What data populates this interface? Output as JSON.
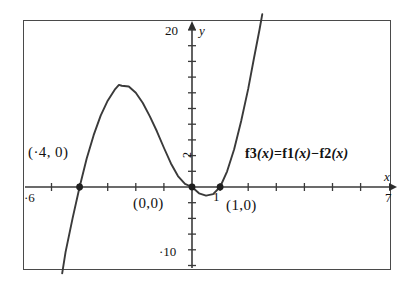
{
  "chart_data": {
    "type": "line",
    "title": "",
    "xlabel": "x",
    "ylabel": "y",
    "xlim": [
      -6,
      7
    ],
    "ylim": [
      -10,
      20
    ],
    "grid": false,
    "legend": null,
    "annotations": {
      "formula": "f3(x)=f1(x)−f2(x)",
      "formula_parts": {
        "f3": "f3",
        "eq": "=",
        "f1": "f1",
        "minus": "−",
        "f2": "f2",
        "var": "x"
      }
    },
    "axis_tick_labels": {
      "x_left": "·6",
      "x_right": "7",
      "x_one": "1",
      "y_top": "20",
      "y_bottom": "·10",
      "y_two": "2"
    },
    "x_ticks": [
      -6,
      -5,
      -4,
      -3,
      -2,
      -1,
      0,
      1,
      2,
      3,
      4,
      5,
      6,
      7
    ],
    "y_ticks": [
      -10,
      -8,
      -6,
      -4,
      -2,
      0,
      2,
      4,
      6,
      8,
      10,
      12,
      14,
      16,
      18,
      20
    ],
    "marked_points": [
      {
        "label": "(·4, 0)",
        "x": -4,
        "y": 0
      },
      {
        "label": "(0,0)",
        "x": 0,
        "y": 0
      },
      {
        "label": "(1,0)",
        "x": 1,
        "y": 0
      }
    ],
    "series": [
      {
        "name": "f3",
        "roots": [
          -4,
          0,
          1
        ],
        "local_max": {
          "x": -2.6,
          "y": 13.0
        },
        "local_min": {
          "x": 0.55,
          "y": -1.1
        },
        "color": "#3a3a3a",
        "points": [
          {
            "x": -4.62,
            "y": -11.0
          },
          {
            "x": -4.5,
            "y": -8.3
          },
          {
            "x": -4.25,
            "y": -4.0
          },
          {
            "x": -4.0,
            "y": 0.0
          },
          {
            "x": -3.75,
            "y": 3.6
          },
          {
            "x": -3.5,
            "y": 6.6
          },
          {
            "x": -3.25,
            "y": 9.1
          },
          {
            "x": -3.0,
            "y": 11.0
          },
          {
            "x": -2.75,
            "y": 12.4
          },
          {
            "x": -2.6,
            "y": 13.0
          },
          {
            "x": -2.5,
            "y": 12.9
          },
          {
            "x": -2.25,
            "y": 12.8
          },
          {
            "x": -2.0,
            "y": 12.0
          },
          {
            "x": -1.75,
            "y": 10.7
          },
          {
            "x": -1.5,
            "y": 9.0
          },
          {
            "x": -1.25,
            "y": 7.1
          },
          {
            "x": -1.0,
            "y": 5.0
          },
          {
            "x": -0.75,
            "y": 3.0
          },
          {
            "x": -0.5,
            "y": 1.4
          },
          {
            "x": -0.25,
            "y": 0.4
          },
          {
            "x": 0.0,
            "y": 0.0
          },
          {
            "x": 0.25,
            "y": -0.8
          },
          {
            "x": 0.5,
            "y": -1.1
          },
          {
            "x": 0.75,
            "y": -0.9
          },
          {
            "x": 1.0,
            "y": 0.0
          },
          {
            "x": 1.25,
            "y": 2.0
          },
          {
            "x": 1.5,
            "y": 4.8
          },
          {
            "x": 1.75,
            "y": 8.4
          },
          {
            "x": 2.0,
            "y": 12.5
          },
          {
            "x": 2.2,
            "y": 16.3
          },
          {
            "x": 2.4,
            "y": 20.0
          },
          {
            "x": 2.5,
            "y": 22.0
          }
        ]
      }
    ]
  },
  "figure": {
    "frame_color": "#4a4a4a",
    "axis_color": "#3a3a3a",
    "curve_color": "#3a3a3a",
    "background": "#ffffff"
  }
}
